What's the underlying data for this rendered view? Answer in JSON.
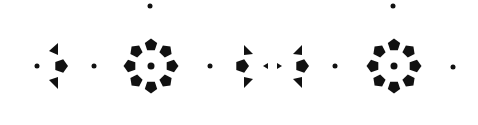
{
  "pattern": {
    "description": "Black geometric ornament pattern on white: two pentagon rings flanked by dots and arrow-like triangle clusters",
    "colors": {
      "fill": "#111111",
      "background": "#ffffff"
    },
    "dots": [
      {
        "x": 37,
        "y": 66,
        "r": 2.5
      },
      {
        "x": 94,
        "y": 66,
        "r": 2.5
      },
      {
        "x": 150,
        "y": 6,
        "r": 2.5
      },
      {
        "x": 151,
        "y": 66,
        "r": 3.5
      },
      {
        "x": 210,
        "y": 66,
        "r": 2.5
      },
      {
        "x": 335,
        "y": 66,
        "r": 2.5
      },
      {
        "x": 393,
        "y": 6,
        "r": 2.5
      },
      {
        "x": 394,
        "y": 66,
        "r": 3.5
      },
      {
        "x": 453,
        "y": 67,
        "r": 2.5
      }
    ],
    "rings": [
      {
        "cx": 151,
        "cy": 66,
        "radius": 21,
        "count": 8,
        "size": 6.5
      },
      {
        "cx": 394,
        "cy": 66,
        "radius": 21,
        "count": 8,
        "size": 6.5
      }
    ],
    "pentagons": [
      {
        "x": 61,
        "y": 66,
        "size": 7
      },
      {
        "x": 242,
        "y": 66,
        "size": 7
      },
      {
        "x": 302,
        "y": 66,
        "size": 7
      }
    ],
    "triangles": [
      {
        "points": "49,51 58,43 58,55"
      },
      {
        "points": "49,80 58,77 58,89"
      },
      {
        "points": "244,45 253,54 244,55"
      },
      {
        "points": "244,77 253,79 244,88"
      },
      {
        "points": "302,45 293,54 302,55"
      },
      {
        "points": "302,77 293,79 302,88"
      },
      {
        "points": "263,66 268,63 268,69"
      },
      {
        "points": "282,66 277,63 277,69"
      }
    ]
  }
}
